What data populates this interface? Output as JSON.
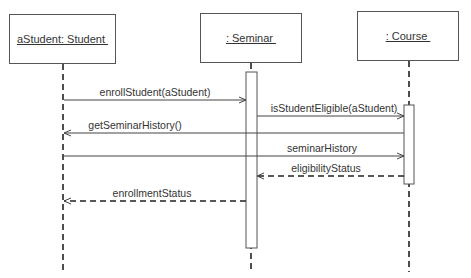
{
  "diagram": {
    "type": "uml-sequence",
    "participants": [
      {
        "id": "student",
        "label": "aStudent: Student ",
        "x": 9,
        "y": 14,
        "w": 107,
        "h": 50,
        "lifeline_x": 63
      },
      {
        "id": "seminar",
        "label": ": Seminar ",
        "x": 200,
        "y": 13,
        "w": 102,
        "h": 50,
        "lifeline_x": 251
      },
      {
        "id": "course",
        "label": ": Course ",
        "x": 357,
        "y": 11,
        "w": 102,
        "h": 50,
        "lifeline_x": 409
      }
    ],
    "activations": [
      {
        "participant": "seminar",
        "x": 246,
        "y_start": 72,
        "y_end": 248,
        "w": 11
      },
      {
        "participant": "course",
        "x": 404,
        "y_start": 105,
        "y_end": 184,
        "w": 10
      }
    ],
    "messages": [
      {
        "label": "enrollStudent(aStudent)",
        "from": "student",
        "to": "seminar",
        "y": 100,
        "style": "solid",
        "x1": 64,
        "x2": 246,
        "label_x": 155,
        "label_y": 86
      },
      {
        "label": "isStudentEligible(aStudent)",
        "from": "seminar",
        "to": "course",
        "y": 116,
        "style": "solid",
        "x1": 257,
        "x2": 404,
        "label_x": 334,
        "label_y": 102
      },
      {
        "label": "getSeminarHistory()",
        "from": "course",
        "to": "student",
        "y": 133,
        "style": "solid",
        "x1": 404,
        "x2": 64,
        "label_x": 135,
        "label_y": 119
      },
      {
        "label": "seminarHistory",
        "from": "student",
        "to": "course",
        "y": 156,
        "style": "solid",
        "x1": 64,
        "x2": 404,
        "label_x": 322,
        "label_y": 142
      },
      {
        "label": "eligibilityStatus",
        "from": "course",
        "to": "seminar",
        "y": 176,
        "style": "dashed",
        "x1": 404,
        "x2": 257,
        "label_x": 326,
        "label_y": 162
      },
      {
        "label": "enrollmentStatus",
        "from": "seminar",
        "to": "student",
        "y": 201,
        "style": "dashed",
        "x1": 246,
        "x2": 64,
        "label_x": 152,
        "label_y": 187
      }
    ],
    "lifeline_end_y": 272,
    "colors": {
      "line": "#444444",
      "box_border": "#555555",
      "text": "#333333"
    }
  }
}
